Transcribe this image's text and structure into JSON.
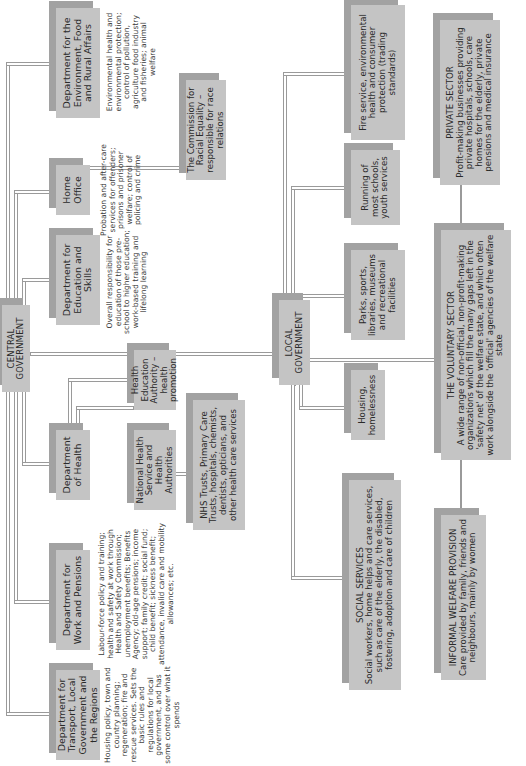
{
  "diagram": {
    "orientation": "rotated 90 degrees counter-clockwise",
    "central_government": {
      "label": "CENTRAL GOVERNMENT",
      "departments": [
        {
          "id": "defra",
          "label": "Department for the Environment, Food and Rural Affairs",
          "description": "Environmental health and environmental protection; control of pollution, agriculture food industry and fisheries; animal welfare"
        },
        {
          "id": "home-office",
          "label": "Home Office",
          "description": "Probation and after-care services for offenders; prisons and prisoner welfare; control of policing and crime"
        },
        {
          "id": "dfes",
          "label": "Department for Education and Skills",
          "description": "Overall responsibility for education of those pre-school to higher education; work-based training and lifelong learning"
        },
        {
          "id": "doh",
          "label": "Department of Health",
          "description": ""
        },
        {
          "id": "dwp",
          "label": "Department for Work and Pensions",
          "description": "Labour-force policy and training; health and safety at work through Health and Safety Commission; unemployment benefits; Benefits Agency; old-age pensions; income support; family credit; social fund; child benefit; sickness benefit; attendance, invalid care and mobility allowances; etc."
        },
        {
          "id": "dtlr",
          "label": "Department for Transport, Local Government and the Regions",
          "description": "Housing policy, town and country planning; regeneration; fire and rescue services. Sets the basic rules and regulations for local government, and has some control over what it spends"
        }
      ],
      "home_office_child": "The Commission for Racial Equality – responsible for race relations",
      "health_children": [
        "Health Education Authority – health promotion",
        "National Health Service and Health Authorities"
      ],
      "nhs_child": "NHS Trusts, Primary Care Trusts, hospitals, chemists, dentists, opticians, and other health care services"
    },
    "local_government": {
      "label": "LOCAL GOVERNMENT",
      "services": [
        "Fire service, environmental health and consumer protection (trading standards)",
        "Running of most schools, youth services",
        "Parks, sports, libraries, museums and recreational facilities",
        "Housing, homelessness"
      ],
      "social_services": {
        "title": "SOCIAL SERVICES",
        "text": "Social workers, home helps and care services, such as care of the elderly, the disabled, fostering, adoption and care of children"
      }
    },
    "other_sectors": {
      "private": {
        "title": "PRIVATE SECTOR",
        "text": "Profit-making businesses providing private hospitals, schools, care homes for the elderly, private pensions and medical insurance"
      },
      "voluntary": {
        "title": "THE VOLUNTARY SECTOR",
        "text": "A wide range of non-official, non-profit-making organizations which fill the many gaps left in the 'safety net' of the welfare state, and which often work alongside the 'official' agencies of the welfare state"
      },
      "informal": {
        "title": "INFORMAL WELFARE PROVISION",
        "text": "Care provided by family, friends and neighbours, mainly by women"
      }
    },
    "colors": {
      "box_fill": "#c4c4c4",
      "box_shadow": "#a2a2a2",
      "connector": "#9a9a9a",
      "text": "#2a2a2a"
    }
  }
}
